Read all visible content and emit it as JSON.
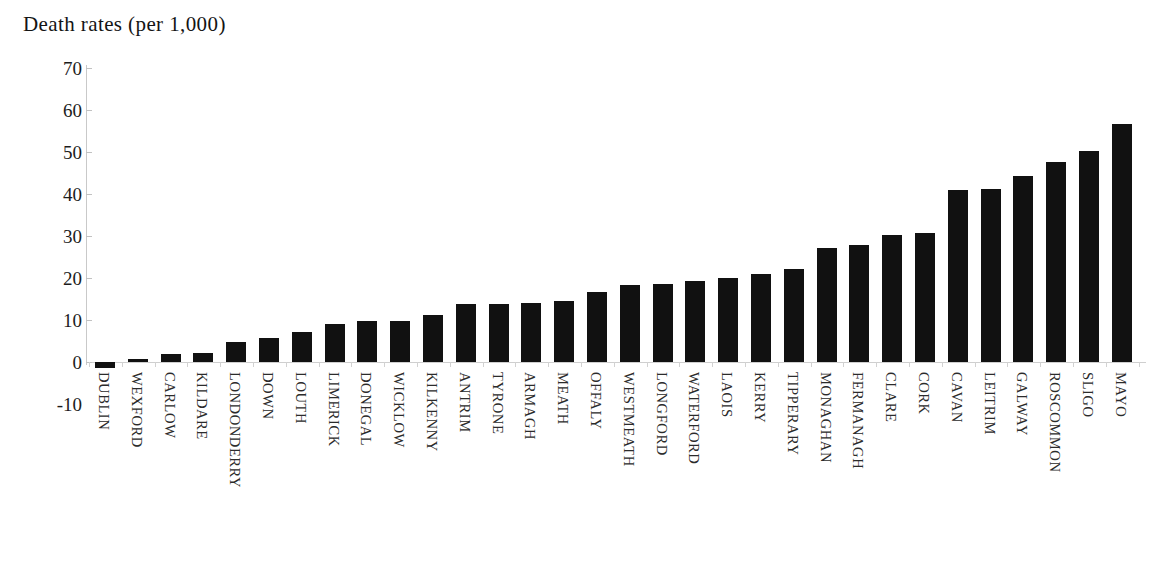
{
  "chart_data": {
    "type": "bar",
    "title": "Death rates (per 1,000)",
    "xlabel": "",
    "ylabel": "",
    "ylim": [
      -10,
      70
    ],
    "yticks": [
      70,
      60,
      50,
      40,
      30,
      20,
      10,
      0,
      -10
    ],
    "ytick_labels": [
      "70",
      "60",
      "50",
      "40",
      "30",
      "20",
      "10",
      "0",
      "-10"
    ],
    "grid": false,
    "legend": null,
    "bar_color": "#111111",
    "categories": [
      "DUBLIN",
      "WEXFORD",
      "CARLOW",
      "KILDARE",
      "LONDONDERRY",
      "DOWN",
      "LOUTH",
      "LIMERICK",
      "DONEGAL",
      "WICKLOW",
      "KILKENNY",
      "ANTRIM",
      "TYRONE",
      "ARMAGH",
      "MEATH",
      "OFFALY",
      "WESTMEATH",
      "LONGFORD",
      "WATERFORD",
      "LAOIS",
      "KERRY",
      "TIPPERARY",
      "MONAGHAN",
      "FERMANAGH",
      "CLARE",
      "CORK",
      "CAVAN",
      "LEITRIM",
      "GALWAY",
      "ROSCOMMON",
      "SLIGO",
      "MAYO"
    ],
    "values": [
      -1.5,
      0.8,
      1.8,
      2.2,
      4.7,
      5.6,
      7.2,
      9.0,
      9.7,
      9.8,
      11.3,
      13.7,
      13.9,
      14.0,
      14.5,
      16.6,
      18.4,
      18.6,
      19.2,
      20.0,
      20.9,
      22.2,
      27.2,
      27.9,
      30.3,
      30.7,
      41.0,
      41.3,
      44.3,
      47.7,
      50.3,
      56.7
    ]
  }
}
